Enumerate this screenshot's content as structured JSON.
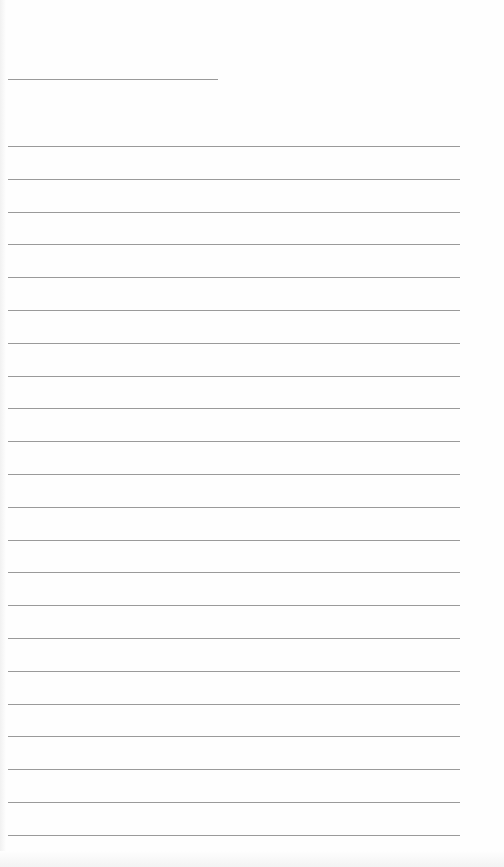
{
  "page": {
    "type": "lined-paper",
    "background_color": "#fefefe",
    "rule_color": "#9a9a9a",
    "title_line": {
      "x": 8,
      "y": 79,
      "width": 210
    },
    "lines": {
      "count": 22,
      "x": 8,
      "width": 452,
      "first_y": 146,
      "spacing": 32.8
    }
  }
}
